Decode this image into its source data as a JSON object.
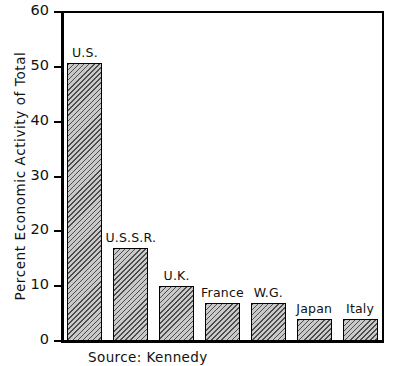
{
  "chart_data": {
    "type": "bar",
    "title": "",
    "xlabel": "",
    "ylabel": "Percent Economic Activity of Total",
    "ylim": [
      0,
      60
    ],
    "yticks": [
      0,
      10,
      20,
      30,
      40,
      50,
      60
    ],
    "ytick_labels": [
      "0",
      "10",
      "20",
      "30",
      "40",
      "50",
      "60"
    ],
    "grid": false,
    "legend": "none",
    "categories": [
      "U.S.",
      "U.S.S.R.",
      "U.K.",
      "France",
      "W.G.",
      "Japan",
      "Italy"
    ],
    "values": [
      50.7,
      17.0,
      10.0,
      6.9,
      6.9,
      4.1,
      4.1
    ],
    "annotation": "Source: Kennedy",
    "bar_fill": "#c9c9c9",
    "bar_hatch": "diagonal",
    "bar_edge_color": "#000000",
    "axis_color": "#000000",
    "background": "#ffffff"
  },
  "caption": {
    "source_text": "Source: Kennedy"
  }
}
